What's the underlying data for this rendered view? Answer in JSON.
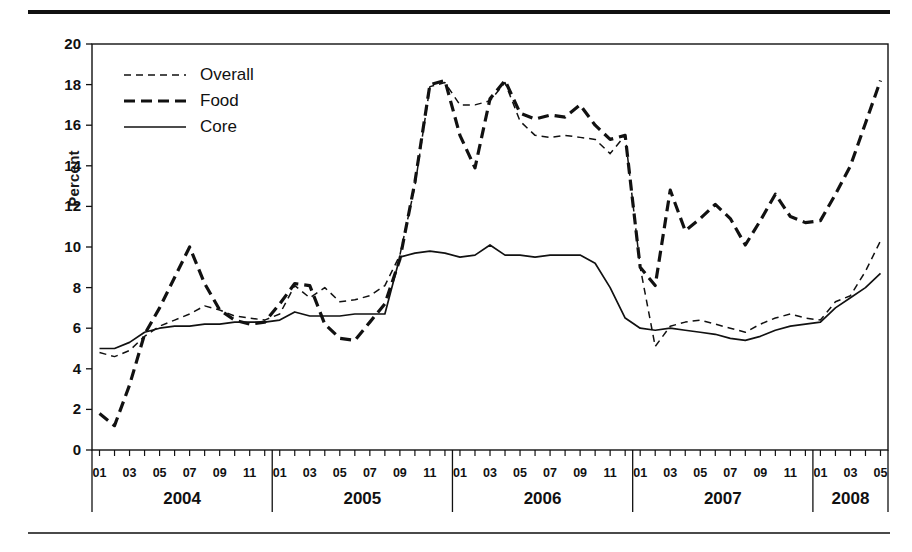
{
  "figure": {
    "ylabel": "Percent",
    "legend": [
      {
        "key": "overall",
        "label": "Overall",
        "style": "thin-dashed"
      },
      {
        "key": "food",
        "label": "Food",
        "style": "thick-dashed"
      },
      {
        "key": "core",
        "label": "Core",
        "style": "solid"
      }
    ],
    "years": [
      "2004",
      "2005",
      "2006",
      "2007",
      "2008"
    ],
    "month_ticks": [
      "01",
      "03",
      "05",
      "07",
      "09",
      "11"
    ],
    "month_ticks_2008": [
      "01",
      "03",
      "05"
    ],
    "colors": {
      "ink": "#111111",
      "rule": "#4a4a4a",
      "background": "#ffffff"
    }
  },
  "chart_data": {
    "type": "line",
    "title": "",
    "xlabel": "",
    "ylabel": "Percent",
    "ylim": [
      0,
      20
    ],
    "ytick_values": [
      0,
      2,
      4,
      6,
      8,
      10,
      12,
      14,
      16,
      18,
      20
    ],
    "grid": false,
    "legend_position": "top-left inside axes",
    "x": [
      "2004-01",
      "2004-02",
      "2004-03",
      "2004-04",
      "2004-05",
      "2004-06",
      "2004-07",
      "2004-08",
      "2004-09",
      "2004-10",
      "2004-11",
      "2004-12",
      "2005-01",
      "2005-02",
      "2005-03",
      "2005-04",
      "2005-05",
      "2005-06",
      "2005-07",
      "2005-08",
      "2005-09",
      "2005-10",
      "2005-11",
      "2005-12",
      "2006-01",
      "2006-02",
      "2006-03",
      "2006-04",
      "2006-05",
      "2006-06",
      "2006-07",
      "2006-08",
      "2006-09",
      "2006-10",
      "2006-11",
      "2006-12",
      "2007-01",
      "2007-02",
      "2007-03",
      "2007-04",
      "2007-05",
      "2007-06",
      "2007-07",
      "2007-08",
      "2007-09",
      "2007-10",
      "2007-11",
      "2007-12",
      "2008-01",
      "2008-02",
      "2008-03",
      "2008-04",
      "2008-05"
    ],
    "series": [
      {
        "name": "Overall",
        "style": "thin-dashed",
        "values": [
          4.8,
          4.6,
          4.9,
          5.6,
          6.1,
          6.4,
          6.7,
          7.1,
          6.9,
          6.6,
          6.5,
          6.4,
          6.7,
          8.1,
          7.5,
          8.0,
          7.3,
          7.4,
          7.6,
          8.1,
          9.6,
          13.0,
          17.9,
          18.1,
          17.0,
          17.0,
          17.2,
          18.1,
          16.2,
          15.5,
          15.4,
          15.5,
          15.4,
          15.3,
          14.6,
          15.5,
          9.0,
          5.1,
          6.1,
          6.3,
          6.4,
          6.2,
          6.0,
          5.8,
          6.2,
          6.5,
          6.7,
          6.5,
          6.4,
          7.3,
          7.6,
          8.8,
          10.3
        ]
      },
      {
        "name": "Food",
        "style": "thick-dashed",
        "values": [
          1.8,
          1.2,
          3.2,
          5.7,
          7.0,
          8.5,
          10.0,
          8.2,
          6.9,
          6.4,
          6.2,
          6.3,
          7.2,
          8.2,
          8.1,
          6.2,
          5.5,
          5.4,
          6.3,
          7.2,
          9.4,
          13.2,
          18.0,
          18.2,
          15.5,
          13.9,
          17.3,
          18.2,
          16.6,
          16.3,
          16.5,
          16.4,
          17.0,
          16.0,
          15.3,
          15.5,
          9.0,
          8.1,
          12.8,
          10.8,
          11.4,
          12.1,
          11.4,
          10.1,
          11.3,
          12.6,
          11.5,
          11.2,
          11.3,
          12.6,
          14.0,
          16.1,
          18.2
        ]
      },
      {
        "name": "Core",
        "style": "solid",
        "values": [
          5.0,
          5.0,
          5.3,
          5.8,
          6.0,
          6.1,
          6.1,
          6.2,
          6.2,
          6.3,
          6.3,
          6.3,
          6.4,
          6.8,
          6.6,
          6.6,
          6.6,
          6.7,
          6.7,
          6.7,
          9.5,
          9.7,
          9.8,
          9.7,
          9.5,
          9.6,
          10.1,
          9.6,
          9.6,
          9.5,
          9.6,
          9.6,
          9.6,
          9.2,
          8.0,
          6.5,
          6.0,
          5.9,
          6.0,
          5.9,
          5.8,
          5.7,
          5.5,
          5.4,
          5.6,
          5.9,
          6.1,
          6.2,
          6.3,
          7.0,
          7.5,
          8.0,
          8.7
        ]
      }
    ]
  }
}
